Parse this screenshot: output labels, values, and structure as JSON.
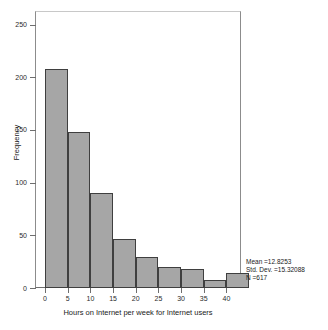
{
  "chart_data": {
    "type": "bar",
    "title": "",
    "subtitle": "",
    "xlabel": "Hours on Internet per week for Internet users",
    "ylabel": "Frequency",
    "bin_width": 5,
    "bin_starts": [
      0,
      5,
      10,
      15,
      20,
      25,
      30,
      35,
      40
    ],
    "categories": [
      "0-5",
      "5-10",
      "10-15",
      "15-20",
      "20-25",
      "25-30",
      "30-35",
      "35-40",
      "40-45"
    ],
    "values": [
      208,
      148,
      90,
      47,
      29,
      20,
      18,
      8,
      14
    ],
    "xlim": [
      -2,
      43
    ],
    "ylim": [
      0,
      262
    ],
    "xticks": [
      0,
      5,
      10,
      15,
      20,
      25,
      30,
      35,
      40
    ],
    "xtick_labels": [
      "0",
      "5",
      "10",
      "15",
      "20",
      "25",
      "30",
      "35",
      "40"
    ],
    "yticks": [
      0,
      50,
      100,
      150,
      200,
      250
    ],
    "ytick_labels": [
      "0",
      "50",
      "100",
      "150",
      "200",
      "250"
    ],
    "grid": false,
    "legend": null,
    "annotations": {
      "mean": "Mean =12.8253",
      "std_dev": "Std. Dev. =15.32088",
      "n": "N =617"
    },
    "colors": {
      "bar_fill": "#a6a6a6",
      "bar_edge": "#3f3f3f",
      "axis": "#6e6e6e",
      "text": "#1a1a1a",
      "background": "#ffffff"
    }
  }
}
